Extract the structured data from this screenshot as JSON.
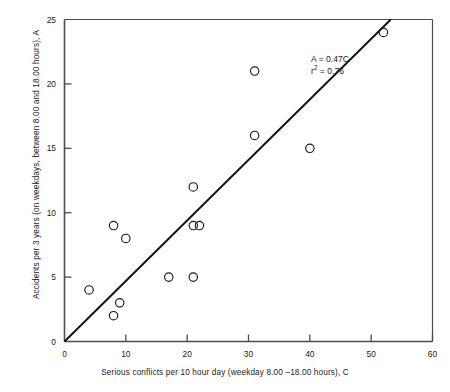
{
  "chart_data": {
    "type": "scatter",
    "title": "",
    "xlabel": "Serious conflicts per 10 hour day (weekday 8.00 –18.00 hours), C",
    "ylabel": "Accidents per 3 years (on weekdays, between 8.00 and 18.00 hours), A",
    "xlim": [
      0,
      60
    ],
    "ylim": [
      0,
      25
    ],
    "xticks": [
      0,
      10,
      20,
      30,
      40,
      50,
      60
    ],
    "yticks": [
      0,
      5,
      10,
      15,
      20,
      25
    ],
    "xtick_labels": [
      "0",
      "10",
      "20",
      "30",
      "40",
      "50",
      "60"
    ],
    "ytick_labels": [
      "0",
      "5",
      "10",
      "15",
      "20",
      "25"
    ],
    "grid": false,
    "legend": null,
    "marker": "open-circle",
    "points": [
      {
        "x": 4,
        "y": 4
      },
      {
        "x": 8,
        "y": 9
      },
      {
        "x": 8,
        "y": 2
      },
      {
        "x": 9,
        "y": 3
      },
      {
        "x": 10,
        "y": 8
      },
      {
        "x": 17,
        "y": 5
      },
      {
        "x": 21,
        "y": 12
      },
      {
        "x": 21,
        "y": 9
      },
      {
        "x": 22,
        "y": 9
      },
      {
        "x": 21,
        "y": 5
      },
      {
        "x": 31,
        "y": 21
      },
      {
        "x": 31,
        "y": 16
      },
      {
        "x": 40,
        "y": 15
      },
      {
        "x": 52,
        "y": 24
      }
    ],
    "fit_line": {
      "equation": "A = 0.47C",
      "slope": 0.47,
      "intercept": 0,
      "r_squared": 0.76,
      "r_squared_label": "r² = 0.76",
      "x_start": 0,
      "x_end": 53.2
    },
    "annotations": [
      {
        "name": "equation",
        "text": "A = 0.47C"
      },
      {
        "name": "r-squared",
        "text_prefix": "r",
        "text_sup": "2",
        "text_suffix": " = 0.76"
      }
    ]
  },
  "colors": {
    "axis": "#4d4d4d",
    "frame": "#4d4d4d",
    "marker_stroke": "#1a1a1a",
    "fit_line": "#111111",
    "text": "#1a1a1a",
    "background": "#ffffff"
  }
}
